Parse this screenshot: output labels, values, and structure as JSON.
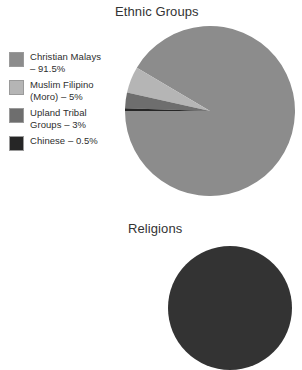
{
  "page": {
    "background_color": "#ffffff"
  },
  "charts": [
    {
      "id": "ethnic-groups",
      "title": "Ethnic Groups",
      "legend": [
        {
          "label_lines": [
            "Christian Malays",
            "– 91.5%"
          ],
          "name": "Christian Malays",
          "value": 91.5,
          "color": "#8c8c8c"
        },
        {
          "label_lines": [
            "Muslim Filipino",
            "(Moro) – 5%"
          ],
          "name": "Muslim Filipino (Moro)",
          "value": 5,
          "color": "#b5b5b5"
        },
        {
          "label_lines": [
            "Upland Tribal",
            "Groups – 3%"
          ],
          "name": "Upland Tribal Groups",
          "value": 3,
          "color": "#6e6e6e"
        },
        {
          "label_lines": [
            "Chinese – 0.5%"
          ],
          "name": "Chinese",
          "value": 0.5,
          "color": "#262626"
        }
      ]
    },
    {
      "id": "religions",
      "title": "Religions",
      "note": "chart cropped by bottom edge of image",
      "legend": []
    }
  ],
  "chart_data": [
    {
      "type": "pie",
      "title": "Ethnic Groups",
      "categories": [
        "Christian Malays",
        "Muslim Filipino (Moro)",
        "Upland Tribal Groups",
        "Chinese"
      ],
      "values": [
        91.5,
        5,
        3,
        0.5
      ],
      "value_labels": [
        "91.5%",
        "5%",
        "3%",
        "0.5%"
      ],
      "unit": "percent",
      "colors": [
        "#8c8c8c",
        "#b5b5b5",
        "#6e6e6e",
        "#262626"
      ],
      "legend": "left",
      "grid": false,
      "xlabel": "",
      "ylabel": "",
      "start_angle_deg": 180,
      "direction": "counterclockwise"
    },
    {
      "type": "pie",
      "title": "Religions",
      "categories": [],
      "values": [],
      "colors": [
        "#333333"
      ],
      "legend": "none",
      "grid": false,
      "xlabel": "",
      "ylabel": "",
      "cropped": true
    }
  ]
}
